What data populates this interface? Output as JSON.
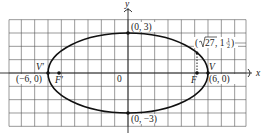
{
  "diagram": {
    "type": "ellipse-graph",
    "equation_hint": "x^2/36 + y^2/9 = 1",
    "axes": {
      "x_label": "x",
      "y_label": "y",
      "origin_label": "0"
    },
    "grid": {
      "x_range": [
        -9,
        9
      ],
      "y_range": [
        -4,
        4
      ],
      "step": 1
    },
    "points": [
      {
        "id": "top",
        "label": "(0, 3)",
        "x": 0,
        "y": 3
      },
      {
        "id": "bottom",
        "label": "(0, −3)",
        "x": 0,
        "y": -3
      },
      {
        "id": "vertex-left",
        "label": "(−6, 0)",
        "name": "V′",
        "x": -6,
        "y": 0
      },
      {
        "id": "vertex-right",
        "label": "(6, 0)",
        "name": "V",
        "x": 6,
        "y": 0
      },
      {
        "id": "focus-left",
        "name": "F′",
        "x": -5.196,
        "y": 0
      },
      {
        "id": "focus-right",
        "name": "F",
        "x": 5.196,
        "y": 0
      },
      {
        "id": "latus-point",
        "label_prefix": "(",
        "label_sqrt": "√",
        "label_radicand": "27",
        "label_mid": ", 1",
        "label_frac_num": "1",
        "label_frac_den": "2",
        "label_suffix": ")",
        "x": 5.196,
        "y": 1.5
      }
    ]
  },
  "labels": {
    "y_axis": "y",
    "x_axis": "x",
    "origin": "0",
    "top": "(0, 3)",
    "bottom": "(0, −3)",
    "v_left_name": "V′",
    "v_left_coord": "(−6, 0)",
    "f_left_name": "F′",
    "v_right_name": "V",
    "v_right_coord": "(6, 0)",
    "f_right_name": "F",
    "latus_open": "(",
    "latus_sqrt_arg": "27",
    "latus_mid": ", 1",
    "latus_num": "1",
    "latus_den": "2",
    "latus_close": ")"
  }
}
